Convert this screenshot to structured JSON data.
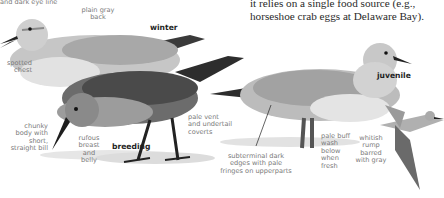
{
  "body_text": {
    "line1": "it relies on a single food source (e.g.,",
    "line2": "horseshoe crab eggs at Delaware Bay)."
  },
  "plumages": {
    "winter": "winter",
    "breeding": "breeding",
    "juvenile": "juvenile"
  },
  "callouts": {
    "eye_line": "and dark eye line",
    "plain_gray_back": "plain gray\nback",
    "spotted_chest": "spotted\nchest",
    "chunky_body": "chunky\nbody with\nshort,\nstraight bill",
    "rufous_breast": "rufous\nbreast\nand\nbelly",
    "pale_vent": "pale vent\nand undertail\ncoverts",
    "subterminal_edges": "subterminal dark\nedges with pale\nfringes on upperparts",
    "pale_buff_wash": "pale buff\nwash\nbelow\nwhen\nfresh",
    "whitish_rump": "whitish\nrump\nbarred\nwith gray"
  },
  "colors": {
    "background": "#ffffff",
    "body_text": "#2a2a2a",
    "callout_text": "#7a7a7a",
    "plumage_label": "#1e1e1e"
  }
}
